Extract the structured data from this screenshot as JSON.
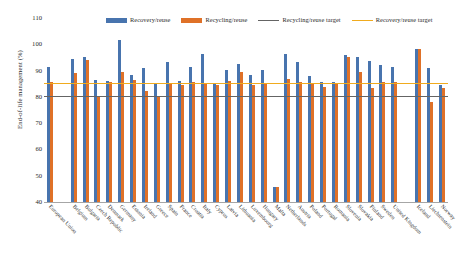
{
  "chart_data": {
    "type": "bar",
    "title": "",
    "xlabel": "",
    "ylabel": "End-of-life management (%)",
    "ylim": [
      40,
      110
    ],
    "yticks": [
      40,
      50,
      60,
      70,
      80,
      90,
      100,
      110
    ],
    "grid": false,
    "legend_position": "top-center",
    "categories": [
      "European Union",
      "",
      "Belgium",
      "Bulgaria",
      "Czech Republic",
      "Denmark",
      "Germany",
      "Estonia",
      "Ireland",
      "Greece",
      "Spain",
      "France",
      "Croatia",
      "Italy",
      "Cyprus",
      "Latvia",
      "Lithuania",
      "Luxembourg",
      "Hungary",
      "Malta",
      "Netherlands",
      "Austria",
      "Poland",
      "Portugal",
      "Romania",
      "Slovenia",
      "Slovakia",
      "Finland",
      "Sweden",
      "United Kingdom",
      "",
      "Iceland",
      "Liechtenstein",
      "Norway"
    ],
    "series": [
      {
        "name": "Recovery/reuse",
        "color": "#4874AE",
        "values": [
          91.3,
          null,
          94.3,
          95.1,
          86.3,
          86.1,
          101.8,
          88.2,
          90.8,
          85.0,
          93.4,
          86.2,
          91.4,
          96.5,
          85.3,
          90.4,
          92.6,
          88.4,
          90.2,
          45.6,
          96.5,
          93.3,
          88.0,
          85.6,
          85.5,
          96.0,
          95.2,
          93.8,
          92.3,
          91.5,
          null,
          98.4,
          91.0,
          84.5
        ]
      },
      {
        "name": "Recycling/reuse",
        "color": "#DF7128",
        "values": [
          85.6,
          null,
          89.1,
          94.0,
          80.0,
          85.6,
          89.4,
          86.6,
          82.2,
          80.1,
          85.0,
          84.4,
          85.8,
          85.4,
          84.6,
          86.1,
          89.5,
          84.5,
          85.0,
          45.8,
          86.7,
          85.6,
          85.2,
          83.9,
          85.3,
          95.0,
          89.6,
          83.4,
          85.5,
          85.5,
          null,
          98.2,
          78.0,
          83.4
        ]
      }
    ],
    "reference_lines": [
      {
        "name": "Recycling/reuse target",
        "value": 80,
        "color": "#646464"
      },
      {
        "name": "Recovery/reuse target",
        "value": 85,
        "color": "#F0AB1E"
      }
    ]
  },
  "legend": {
    "items": [
      {
        "label": "Recovery/reuse",
        "type": "swatch",
        "color": "#4874AE"
      },
      {
        "label": "Recycling/reuse",
        "type": "swatch",
        "color": "#DF7128"
      },
      {
        "label": "Recycling/reuse target",
        "type": "line",
        "color": "#646464"
      },
      {
        "label": "Recovery/reuse target",
        "type": "line",
        "color": "#F0AB1E"
      }
    ]
  }
}
